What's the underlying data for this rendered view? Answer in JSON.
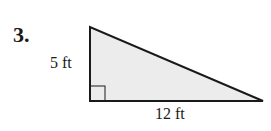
{
  "problem": {
    "number": "3.",
    "figure": "right-triangle",
    "height_label": "5 ft",
    "base_label": "12 ft",
    "fill_color": "#ececec",
    "stroke_color": "#1a1a1a"
  }
}
